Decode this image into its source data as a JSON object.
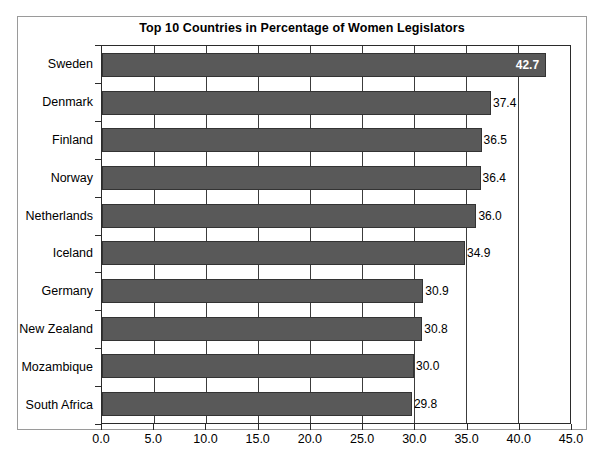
{
  "chart_data": {
    "type": "bar",
    "orientation": "horizontal",
    "title": "Top 10 Countries in Percentage of Women Legislators",
    "xlabel": "",
    "ylabel": "",
    "categories": [
      "Sweden",
      "Denmark",
      "Finland",
      "Norway",
      "Netherlands",
      "Iceland",
      "Germany",
      "New Zealand",
      "Mozambique",
      "South Africa"
    ],
    "values": [
      42.7,
      37.4,
      36.5,
      36.4,
      36.0,
      34.9,
      30.9,
      30.8,
      30.0,
      29.8
    ],
    "value_labels": [
      "42.7",
      "37.4",
      "36.5",
      "36.4",
      "36.0",
      "34.9",
      "30.9",
      "30.8",
      "30.0",
      "29.8"
    ],
    "label_positions": [
      "inside-end",
      "outside-end",
      "outside-end",
      "outside-end",
      "outside-end",
      "outside-end",
      "outside-end",
      "outside-end",
      "outside-end",
      "outside-end"
    ],
    "xlim": [
      0.0,
      45.0
    ],
    "xticks": [
      0.0,
      5.0,
      10.0,
      15.0,
      20.0,
      25.0,
      30.0,
      35.0,
      40.0,
      45.0
    ],
    "xtick_labels": [
      "0.0",
      "5.0",
      "10.0",
      "15.0",
      "20.0",
      "25.0",
      "30.0",
      "35.0",
      "40.0",
      "45.0"
    ],
    "grid": "vertical",
    "legend": "none",
    "bar_color": "#595959",
    "bar_border_color": "#333333",
    "plot_background": "#ffffff",
    "axis_color": "#2b2b2b",
    "gridline_color": "#3c3c3c",
    "inside_label_color": "#ffffff",
    "outside_label_color": "#000000"
  }
}
